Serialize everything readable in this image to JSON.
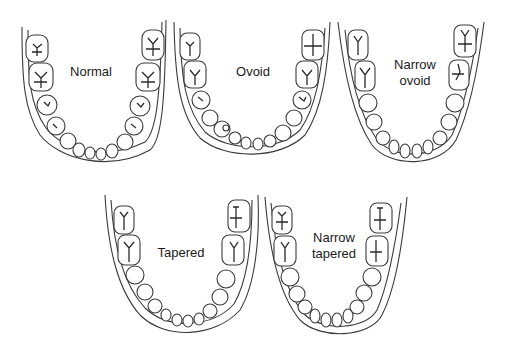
{
  "diagram": {
    "stroke_color": "#3a3a3a",
    "background": "#ffffff",
    "arches": [
      {
        "id": "normal",
        "label": "Normal",
        "row": 1,
        "shape": "broad U"
      },
      {
        "id": "ovoid",
        "label": "Ovoid",
        "row": 1,
        "shape": "rounded oval"
      },
      {
        "id": "narrow-ovoid",
        "label": "Narrow\novoid",
        "row": 1,
        "shape": "narrow oval"
      },
      {
        "id": "tapered",
        "label": "Tapered",
        "row": 2,
        "shape": "V-tapered"
      },
      {
        "id": "narrow-tapered",
        "label": "Narrow\ntapered",
        "row": 2,
        "shape": "narrow V"
      }
    ]
  }
}
